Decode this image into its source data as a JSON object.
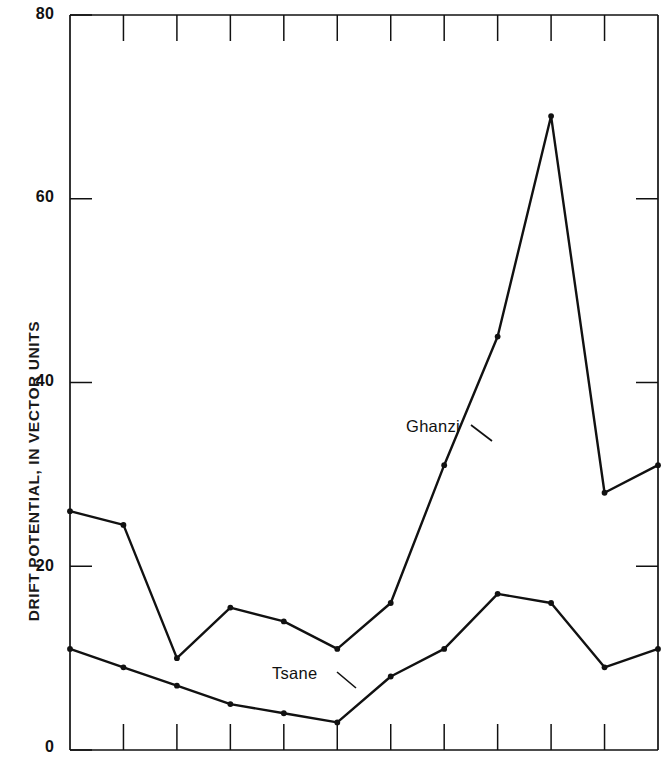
{
  "chart_data": {
    "type": "line",
    "title": "",
    "subtitle": "",
    "xlabel": "",
    "ylabel": "DRIFT POTENTIAL, IN VECTOR UNITS",
    "ylim": [
      0,
      80
    ],
    "yticks": [
      0,
      20,
      40,
      60,
      80
    ],
    "ytick_labels": [
      "0",
      "20",
      "40",
      "60",
      "80"
    ],
    "xlim": [
      0,
      11
    ],
    "x": [
      0,
      1,
      2,
      3,
      4,
      5,
      6,
      7,
      8,
      9,
      10,
      11
    ],
    "xtick_labels": [
      "",
      "",
      "",
      "",
      "",
      "",
      "",
      "",
      "",
      "",
      "",
      ""
    ],
    "x_axis_visible_ticks": 11,
    "grid": false,
    "legend_position": "inline-annotations",
    "series": [
      {
        "name": "Ghanzi",
        "values": [
          26,
          24.5,
          10,
          15.5,
          14,
          11,
          16,
          31,
          45,
          69,
          28,
          31
        ],
        "color": "#111111",
        "marker": "dot"
      },
      {
        "name": "Tsane",
        "values": [
          11,
          9,
          7,
          5,
          4,
          3,
          8,
          11,
          17,
          16,
          9,
          11
        ],
        "color": "#111111",
        "marker": "dot"
      }
    ],
    "annotations": [
      {
        "text": "Ghanzi",
        "x": 406,
        "y": 417,
        "leader_from": [
          471,
          425
        ],
        "leader_to": [
          492,
          441
        ]
      },
      {
        "text": "Tsane",
        "x": 272,
        "y": 664,
        "leader_from": [
          337,
          672
        ],
        "leader_to": [
          356,
          688
        ]
      }
    ]
  }
}
